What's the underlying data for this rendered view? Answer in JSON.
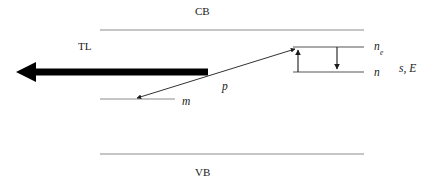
{
  "figure": {
    "type": "energy-band-diagram",
    "background_color": "#ffffff",
    "band_line_color": "#8c8c8c",
    "arrow_color": "#1a1a1a",
    "thick_arrow_color": "#000000",
    "text_color": "#1a1a1a"
  },
  "bands": {
    "conduction": {
      "label": "CB",
      "line_y": 30,
      "line_x1": 100,
      "line_x2": 364
    },
    "valence": {
      "label": "VB",
      "line_y": 154,
      "line_x1": 100,
      "line_x2": 364
    }
  },
  "levels": [
    {
      "name": "excited-trap-level",
      "label": "n",
      "subscript": "e",
      "line_y": 47,
      "line_x1": 293,
      "line_x2": 364,
      "label_x": 374,
      "label_y": 42
    },
    {
      "name": "trap-level",
      "label": "n",
      "subscript": "",
      "line_y": 72,
      "line_x1": 293,
      "line_x2": 364,
      "label_x": 374,
      "label_y": 68
    },
    {
      "name": "recombination-level",
      "label": "m",
      "subscript": "",
      "line_y": 99,
      "line_x1": 100,
      "line_x2": 175,
      "label_x": 183,
      "label_y": 96
    }
  ],
  "transitions": [
    {
      "name": "thermal-excitation-arrow",
      "direction": "up",
      "x": 298,
      "y_from": 72,
      "y_to": 47
    },
    {
      "name": "retrapping-arrow",
      "direction": "down",
      "x": 337,
      "y_from": 47,
      "y_to": 72
    },
    {
      "name": "recombination-arrow",
      "label": "p",
      "direction": "diagonal-both",
      "x_from": 295,
      "y_from": 48,
      "x_to": 136,
      "y_to": 99,
      "label_x": 223,
      "label_y": 82
    }
  ],
  "emission": {
    "name": "thermoluminescence-arrow",
    "label": "TL",
    "direction": "left",
    "x_from": 208,
    "x_to": 18,
    "y": 72,
    "label_x": 84,
    "label_y": 42
  },
  "annotations": {
    "rate_constants": {
      "label": "s, E",
      "x": 401,
      "y": 66
    }
  }
}
